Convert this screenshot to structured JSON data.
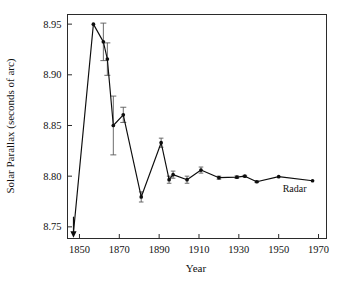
{
  "chart_data": {
    "type": "line",
    "title": "",
    "xlabel": "Year",
    "ylabel": "Solar Parallax (seconds of arc)",
    "xlim": [
      1844,
      1974
    ],
    "ylim": [
      8.7385,
      8.9595
    ],
    "grid": false,
    "legend": null,
    "xticks": [
      1850,
      1870,
      1890,
      1910,
      1930,
      1950,
      1970
    ],
    "xtick_labels": [
      "1850",
      "1870",
      "1890",
      "1910",
      "1930",
      "1950",
      "1970"
    ],
    "yticks": [
      8.75,
      8.8,
      8.85,
      8.9,
      8.95
    ],
    "ytick_labels": [
      "8.75",
      "8.80",
      "8.85",
      "8.90",
      "8.95"
    ],
    "annotations": [
      {
        "text": "Radar",
        "x": 1958,
        "y": 8.7845
      }
    ],
    "series": [
      {
        "name": "Solar parallax determinations",
        "x": [
          1847,
          1857,
          1862,
          1864,
          1867,
          1872,
          1881,
          1891,
          1895,
          1897,
          1904,
          1911,
          1920,
          1929,
          1933,
          1939,
          1950,
          1967
        ],
        "values": [
          8.7445,
          8.95,
          8.9325,
          8.9155,
          8.85,
          8.8605,
          8.7795,
          8.833,
          8.7965,
          8.8015,
          8.7965,
          8.806,
          8.7985,
          8.799,
          8.8,
          8.7945,
          8.7995,
          8.7955
        ],
        "yerr": [
          null,
          0.0,
          0.0185,
          0.016,
          0.029,
          0.0075,
          0.005,
          0.0045,
          0.0035,
          0.0035,
          0.0035,
          0.003,
          0.0015,
          0.0012,
          0.0008,
          0.0008,
          0.0,
          0.0
        ],
        "marker": "circle",
        "color": "#0d0d0d"
      }
    ],
    "off_scale_arrow": {
      "x": 1847,
      "from_y": 8.76,
      "to_y": 8.7405,
      "note": "downward arrow marker at left end"
    }
  }
}
